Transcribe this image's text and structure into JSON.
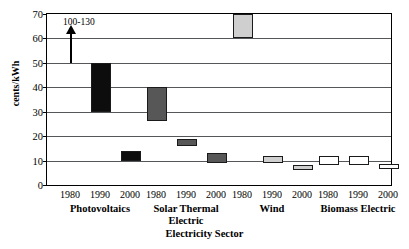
{
  "chart_data": {
    "type": "bar",
    "bar_style": "floating-range",
    "title": "",
    "xlabel": "Electricity Sector",
    "ylabel": "cents/kWh",
    "ylim": [
      0,
      70
    ],
    "yticks": [
      0,
      10,
      20,
      30,
      40,
      50,
      60,
      70
    ],
    "grid": true,
    "legend": "none",
    "categories": [
      "1980",
      "1990",
      "2000"
    ],
    "groups": [
      {
        "name": "Photovoltaics",
        "color": "#0d0d0d",
        "bars": [
          {
            "year": "1980",
            "low": null,
            "high": null,
            "offscale": true,
            "offscale_label": "100-130"
          },
          {
            "year": "1990",
            "low": 30,
            "high": 50
          },
          {
            "year": "2000",
            "low": 10,
            "high": 14
          }
        ]
      },
      {
        "name": "Solar Thermal Electric",
        "color": "#575757",
        "bars": [
          {
            "year": "1980",
            "low": 26,
            "high": 40
          },
          {
            "year": "1990",
            "low": 16,
            "high": 19
          },
          {
            "year": "2000",
            "low": 9,
            "high": 13
          }
        ]
      },
      {
        "name": "Wind",
        "color": "#cfcfcf",
        "bars": [
          {
            "year": "1980",
            "low": 60,
            "high": 70
          },
          {
            "year": "1990",
            "low": 9,
            "high": 12
          },
          {
            "year": "2000",
            "low": 6,
            "high": 8
          }
        ]
      },
      {
        "name": "Biomass Electric",
        "color": "#ffffff",
        "bars": [
          {
            "year": "1980",
            "low": 8,
            "high": 12
          },
          {
            "year": "1990",
            "low": 8,
            "high": 12
          },
          {
            "year": "2000",
            "low": 6.5,
            "high": 8.5
          }
        ]
      }
    ],
    "annotation": {
      "text": "100-130",
      "arrow": "up",
      "from_value": 50,
      "to_value": 62
    }
  },
  "axis": {
    "y_title": "cents/kWh",
    "x_title": "Electricity Sector",
    "y_tick_labels": [
      "0",
      "10",
      "20",
      "30",
      "40",
      "50",
      "60",
      "70"
    ],
    "group_labels": [
      "Photovoltaics",
      "Solar Thermal Electric",
      "Wind",
      "Biomass Electric"
    ],
    "group_labels_wrapped": [
      [
        "Photovoltaics"
      ],
      [
        "Solar Thermal",
        "Electric"
      ],
      [
        "Wind"
      ],
      [
        "Biomass Electric"
      ]
    ],
    "year_labels": [
      "1980",
      "1990",
      "2000"
    ]
  }
}
